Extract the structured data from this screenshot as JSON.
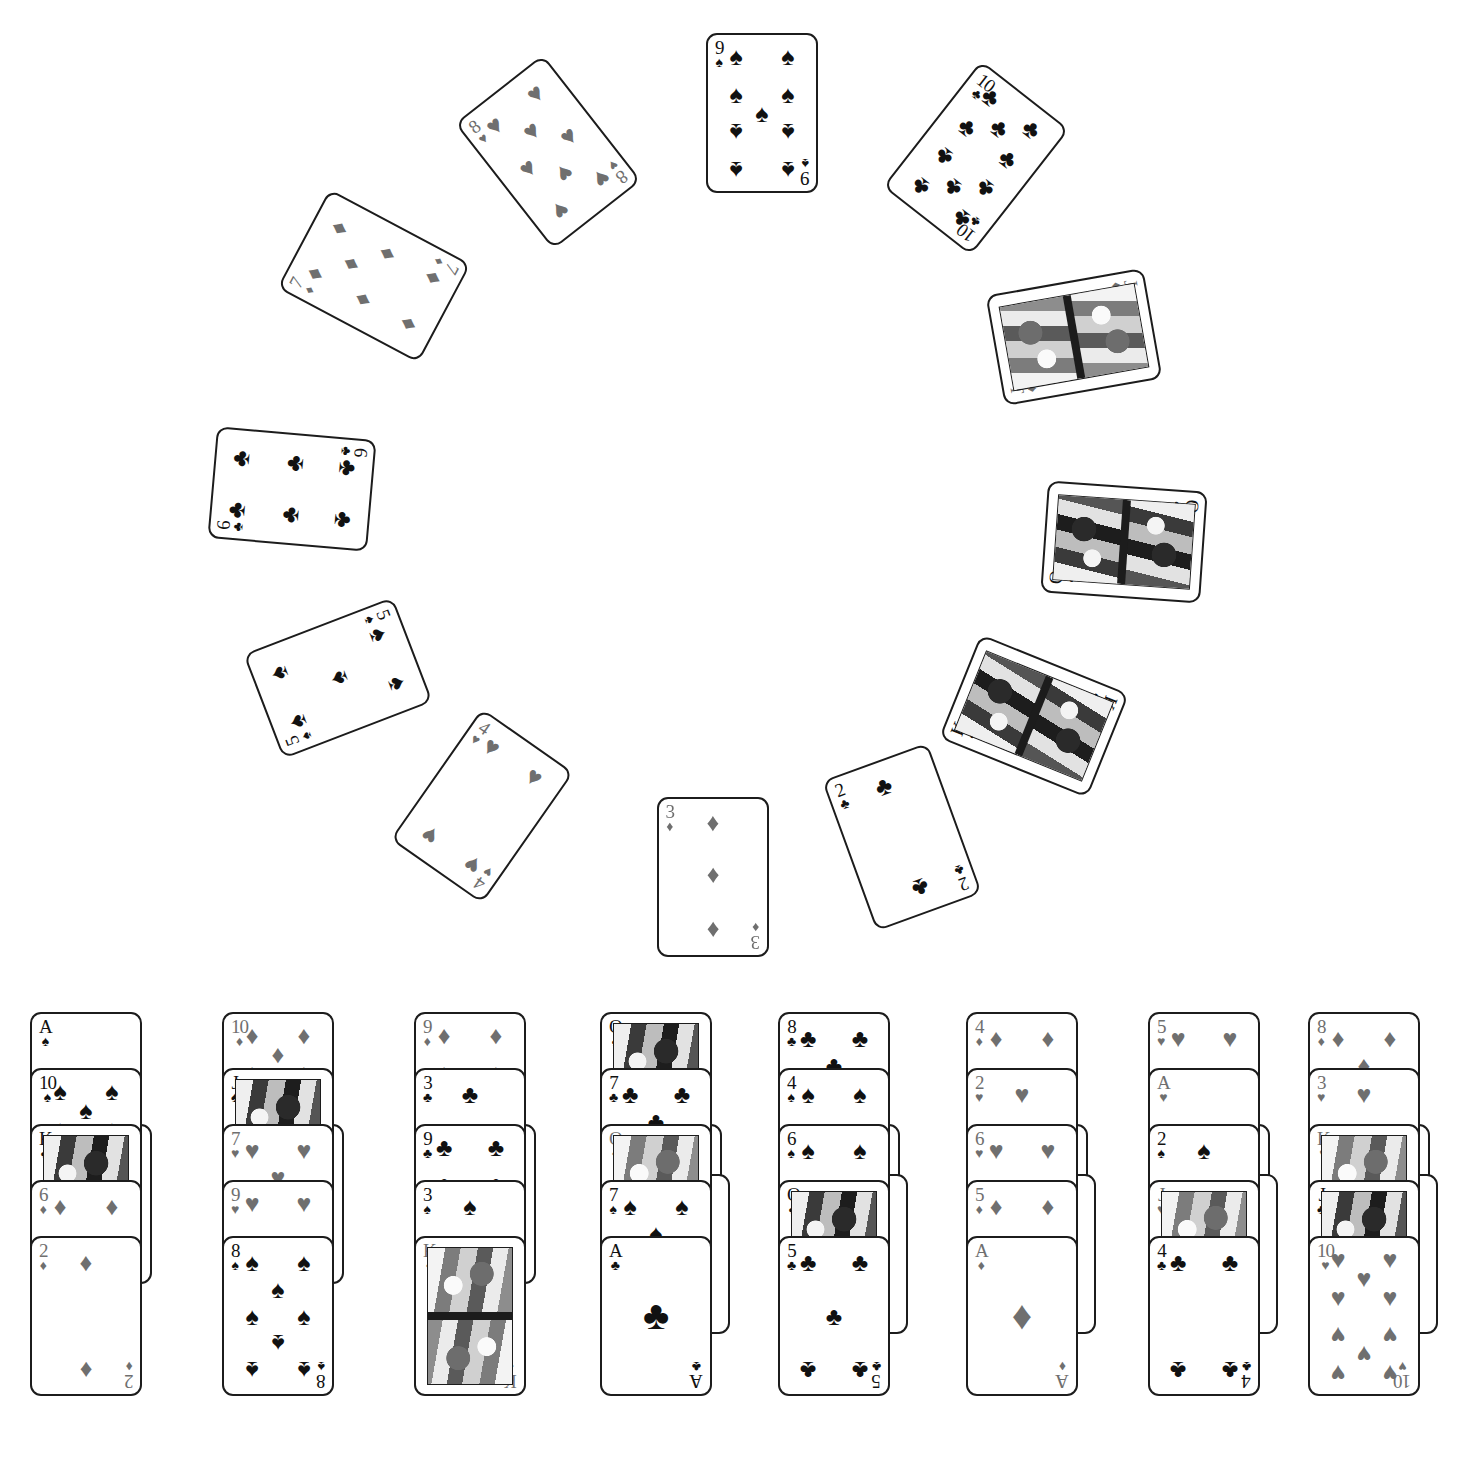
{
  "app": {
    "title": "Solitaire / Patience card game board",
    "background_color": "#ffffff",
    "card_face_color": "#ffffff",
    "card_border_color": "#1c1c1c",
    "black_suit_color": "#111111",
    "red_suit_color": "#6f6f6f",
    "suit_glyphs": {
      "S": "♠",
      "H": "♥",
      "D": "♦",
      "C": "♣"
    }
  },
  "fan": {
    "description": "Thirteen cards arranged in an arc/circle above the tableau",
    "cards": [
      {
        "name": "seven-of-diamonds",
        "rank": "7",
        "suit": "D",
        "color": "red",
        "x": 318,
        "y": 196,
        "rot": -62,
        "court": false
      },
      {
        "name": "eight-of-hearts",
        "rank": "8",
        "suit": "H",
        "color": "red",
        "x": 492,
        "y": 72,
        "rot": -38,
        "court": false
      },
      {
        "name": "nine-of-spades",
        "rank": "9",
        "suit": "S",
        "color": "black",
        "x": 706,
        "y": 33,
        "rot": 0,
        "court": false
      },
      {
        "name": "ten-of-clubs",
        "rank": "10",
        "suit": "C",
        "color": "black",
        "x": 920,
        "y": 78,
        "rot": 38,
        "court": false
      },
      {
        "name": "jack-of-diamonds",
        "rank": "J",
        "suit": "D",
        "color": "red",
        "x": 1018,
        "y": 257,
        "rot": 80,
        "court": true
      },
      {
        "name": "queen-of-spades",
        "rank": "Q",
        "suit": "S",
        "color": "black",
        "x": 1068,
        "y": 462,
        "rot": 94,
        "court": true
      },
      {
        "name": "king-of-spades",
        "rank": "K",
        "suit": "S",
        "color": "black",
        "x": 978,
        "y": 636,
        "rot": 112,
        "court": true
      },
      {
        "name": "two-of-clubs",
        "rank": "2",
        "suit": "C",
        "color": "black",
        "x": 846,
        "y": 757,
        "rot": 160,
        "court": false
      },
      {
        "name": "three-of-diamonds",
        "rank": "3",
        "suit": "D",
        "color": "red",
        "x": 657,
        "y": 797,
        "rot": 180,
        "court": false
      },
      {
        "name": "four-of-hearts",
        "rank": "4",
        "suit": "H",
        "color": "red",
        "x": 426,
        "y": 726,
        "rot": 215,
        "court": false
      },
      {
        "name": "five-of-spades",
        "rank": "5",
        "suit": "S",
        "color": "black",
        "x": 282,
        "y": 598,
        "rot": 249,
        "court": false
      },
      {
        "name": "six-of-clubs",
        "rank": "6",
        "suit": "C",
        "color": "black",
        "x": 236,
        "y": 409,
        "rot": 275,
        "court": false
      }
    ]
  },
  "tableau": {
    "columns": [
      {
        "name": "tableau-column-1",
        "x": 30,
        "hidden_peek": 1,
        "cards": [
          {
            "name": "ace-of-spades",
            "rank": "A",
            "suit": "S",
            "color": "black",
            "court": false
          },
          {
            "name": "ten-of-spades",
            "rank": "10",
            "suit": "S",
            "color": "black",
            "court": false
          },
          {
            "name": "king-of-clubs",
            "rank": "K",
            "suit": "C",
            "color": "black",
            "court": true
          },
          {
            "name": "six-of-diamonds",
            "rank": "6",
            "suit": "D",
            "color": "red",
            "court": false
          },
          {
            "name": "two-of-diamonds",
            "rank": "2",
            "suit": "D",
            "color": "red",
            "court": false
          }
        ]
      },
      {
        "name": "tableau-column-2",
        "x": 222,
        "hidden_peek": 1,
        "cards": [
          {
            "name": "ten-of-diamonds",
            "rank": "10",
            "suit": "D",
            "color": "red",
            "court": false
          },
          {
            "name": "jack-of-spades",
            "rank": "J",
            "suit": "S",
            "color": "black",
            "court": true
          },
          {
            "name": "seven-of-hearts",
            "rank": "7",
            "suit": "H",
            "color": "red",
            "court": false
          },
          {
            "name": "nine-of-hearts",
            "rank": "9",
            "suit": "H",
            "color": "red",
            "court": false
          },
          {
            "name": "eight-of-spades",
            "rank": "8",
            "suit": "S",
            "color": "black",
            "court": false
          }
        ]
      },
      {
        "name": "tableau-column-3",
        "x": 414,
        "hidden_peek": 1,
        "cards": [
          {
            "name": "nine-of-diamonds",
            "rank": "9",
            "suit": "D",
            "color": "red",
            "court": false
          },
          {
            "name": "three-of-clubs",
            "rank": "3",
            "suit": "C",
            "color": "black",
            "court": false
          },
          {
            "name": "nine-of-clubs",
            "rank": "9",
            "suit": "C",
            "color": "black",
            "court": false
          },
          {
            "name": "three-of-spades",
            "rank": "3",
            "suit": "S",
            "color": "black",
            "court": false
          },
          {
            "name": "king-of-diamonds",
            "rank": "K",
            "suit": "D",
            "color": "red",
            "court": true
          }
        ]
      },
      {
        "name": "tableau-column-4",
        "x": 600,
        "hidden_peek": 2,
        "cards": [
          {
            "name": "queen-of-spades-tableau",
            "rank": "Q",
            "suit": "S",
            "color": "black",
            "court": true
          },
          {
            "name": "seven-of-clubs",
            "rank": "7",
            "suit": "C",
            "color": "black",
            "court": false
          },
          {
            "name": "queen-of-diamonds",
            "rank": "Q",
            "suit": "D",
            "color": "red",
            "court": true
          },
          {
            "name": "seven-of-spades",
            "rank": "7",
            "suit": "S",
            "color": "black",
            "court": false
          },
          {
            "name": "ace-of-clubs",
            "rank": "A",
            "suit": "C",
            "color": "black",
            "court": false
          }
        ]
      },
      {
        "name": "tableau-column-5",
        "x": 778,
        "hidden_peek": 2,
        "cards": [
          {
            "name": "eight-of-clubs",
            "rank": "8",
            "suit": "C",
            "color": "black",
            "court": false
          },
          {
            "name": "four-of-spades",
            "rank": "4",
            "suit": "S",
            "color": "black",
            "court": false
          },
          {
            "name": "six-of-spades",
            "rank": "6",
            "suit": "S",
            "color": "black",
            "court": false
          },
          {
            "name": "queen-of-clubs",
            "rank": "Q",
            "suit": "C",
            "color": "black",
            "court": true
          },
          {
            "name": "five-of-clubs",
            "rank": "5",
            "suit": "C",
            "color": "black",
            "court": false
          }
        ]
      },
      {
        "name": "tableau-column-6",
        "x": 966,
        "hidden_peek": 2,
        "cards": [
          {
            "name": "four-of-diamonds",
            "rank": "4",
            "suit": "D",
            "color": "red",
            "court": false
          },
          {
            "name": "two-of-hearts",
            "rank": "2",
            "suit": "H",
            "color": "red",
            "court": false
          },
          {
            "name": "six-of-hearts",
            "rank": "6",
            "suit": "H",
            "color": "red",
            "court": false
          },
          {
            "name": "five-of-diamonds",
            "rank": "5",
            "suit": "D",
            "color": "red",
            "court": false
          },
          {
            "name": "ace-of-diamonds",
            "rank": "A",
            "suit": "D",
            "color": "red",
            "court": false
          }
        ]
      },
      {
        "name": "tableau-column-7",
        "x": 1148,
        "hidden_peek": 2,
        "cards": [
          {
            "name": "five-of-hearts",
            "rank": "5",
            "suit": "H",
            "color": "red",
            "court": false
          },
          {
            "name": "ace-of-hearts",
            "rank": "A",
            "suit": "H",
            "color": "red",
            "court": false
          },
          {
            "name": "two-of-spades",
            "rank": "2",
            "suit": "S",
            "color": "black",
            "court": false
          },
          {
            "name": "jack-of-hearts",
            "rank": "J",
            "suit": "H",
            "color": "red",
            "court": true
          },
          {
            "name": "four-of-clubs",
            "rank": "4",
            "suit": "C",
            "color": "black",
            "court": false
          }
        ]
      },
      {
        "name": "tableau-column-8",
        "x": 1308,
        "hidden_peek": 2,
        "cards": [
          {
            "name": "eight-of-diamonds",
            "rank": "8",
            "suit": "D",
            "color": "red",
            "court": false
          },
          {
            "name": "three-of-hearts",
            "rank": "3",
            "suit": "H",
            "color": "red",
            "court": false
          },
          {
            "name": "king-of-hearts",
            "rank": "K",
            "suit": "H",
            "color": "red",
            "court": true
          },
          {
            "name": "jack-of-clubs",
            "rank": "J",
            "suit": "C",
            "color": "black",
            "court": true
          },
          {
            "name": "ten-of-hearts",
            "rank": "10",
            "suit": "H",
            "color": "red",
            "court": false
          }
        ]
      }
    ],
    "top_y": 1012,
    "overlap_step": 56,
    "card_width": 112,
    "card_height": 160
  }
}
